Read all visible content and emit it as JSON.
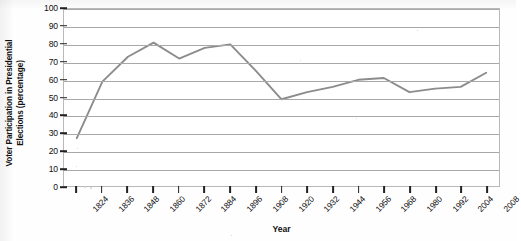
{
  "chart_data": {
    "type": "line",
    "title": "",
    "xlabel": "Year",
    "ylabel": "Voter Participation in Presidential Elections (percentage)",
    "ylabel_lines": [
      "Voter Participation in Presidential",
      "Elections (percentage)"
    ],
    "ylim": [
      0,
      100
    ],
    "ytick_step": 10,
    "yticks": [
      0,
      10,
      20,
      30,
      40,
      50,
      60,
      70,
      80,
      90,
      100
    ],
    "ytick_labels": [
      "0",
      "10",
      "20",
      "30",
      "40",
      "50",
      "60",
      "70",
      "80",
      "90",
      "100"
    ],
    "grid": true,
    "grid_axis": "y",
    "legend": false,
    "legend_position": "none",
    "xticks": [
      1824,
      1836,
      1848,
      1860,
      1872,
      1884,
      1896,
      1908,
      1920,
      1932,
      1944,
      1956,
      1968,
      1980,
      1992,
      2004,
      2008
    ],
    "xtick_labels": [
      "1824",
      "1836",
      "1848",
      "1860",
      "1872",
      "1884",
      "1896",
      "1908",
      "1920",
      "1932",
      "1944",
      "1956",
      "1968",
      "1980",
      "1992",
      "2004",
      "2008"
    ],
    "xtick_label_rotation": -45,
    "categories": [
      "1824",
      "1836",
      "1848",
      "1860",
      "1872",
      "1884",
      "1896",
      "1908",
      "1920",
      "1932",
      "1944",
      "1956",
      "1968",
      "1980",
      "1992",
      "2004",
      "2008"
    ],
    "x": [
      1824,
      1836,
      1848,
      1860,
      1872,
      1884,
      1896,
      1908,
      1920,
      1932,
      1944,
      1956,
      1968,
      1980,
      1992,
      2004,
      2008
    ],
    "values": [
      27,
      59,
      73,
      81,
      72,
      78,
      80,
      65,
      49,
      53,
      56,
      60,
      61,
      53,
      55,
      56,
      64
    ],
    "series": [
      {
        "name": "Voter Participation",
        "color": "#8c8c8c",
        "values": [
          27,
          59,
          73,
          81,
          72,
          78,
          80,
          65,
          49,
          53,
          56,
          60,
          61,
          53,
          55,
          56,
          64
        ]
      }
    ]
  },
  "style": {
    "line_color": "#8c8c8c",
    "grid_color": "#a8a8a8",
    "frame_color": "#b9b9b9",
    "text_color": "#111111",
    "background": "#ffffff"
  }
}
